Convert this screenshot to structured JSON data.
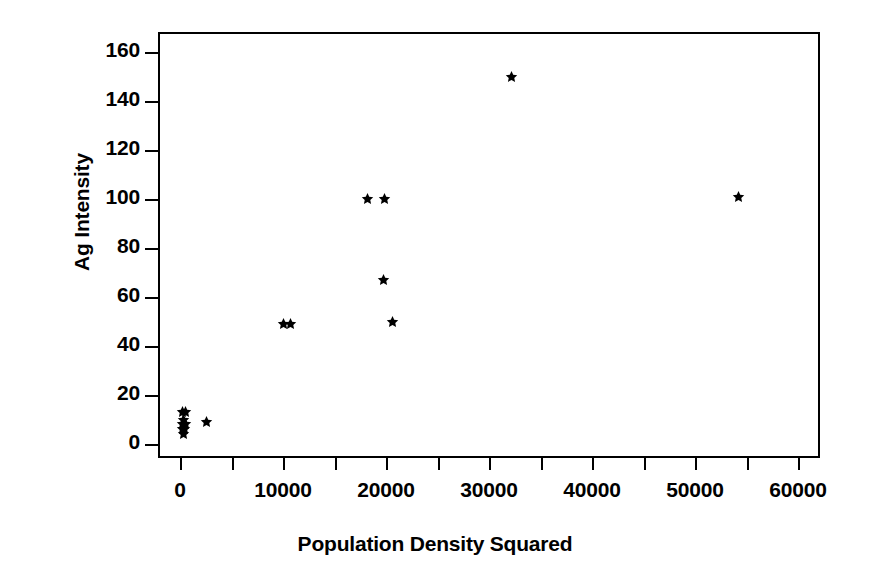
{
  "chart_data": {
    "type": "scatter",
    "title": "",
    "xlabel": "Population Density Squared",
    "ylabel": "Ag Intensity",
    "xlim": [
      -1500,
      64000
    ],
    "ylim": [
      -5,
      168
    ],
    "grid": false,
    "legend": null,
    "marker_style": "star",
    "marker_color": "#000000",
    "xticks": [
      0,
      10000,
      20000,
      30000,
      40000,
      50000,
      60000
    ],
    "xtick_labels": [
      "0",
      "10000",
      "20000",
      "30000",
      "40000",
      "50000",
      "60000"
    ],
    "xticks_minor": [
      5000,
      15000,
      25000,
      35000,
      45000,
      55000
    ],
    "yticks": [
      0,
      20,
      40,
      60,
      80,
      100,
      120,
      140,
      160
    ],
    "ytick_labels": [
      "0",
      "20",
      "40",
      "60",
      "80",
      "100",
      "120",
      "140",
      "160"
    ],
    "points": [
      {
        "x": 60,
        "y": 14
      },
      {
        "x": 330,
        "y": 14
      },
      {
        "x": 120,
        "y": 11
      },
      {
        "x": 60,
        "y": 9
      },
      {
        "x": 330,
        "y": 9
      },
      {
        "x": 90,
        "y": 7
      },
      {
        "x": 250,
        "y": 7
      },
      {
        "x": 150,
        "y": 5
      },
      {
        "x": 2400,
        "y": 10
      },
      {
        "x": 9900,
        "y": 50
      },
      {
        "x": 10500,
        "y": 50
      },
      {
        "x": 18000,
        "y": 101
      },
      {
        "x": 19700,
        "y": 101
      },
      {
        "x": 19600,
        "y": 68
      },
      {
        "x": 20400,
        "y": 51
      },
      {
        "x": 32000,
        "y": 151
      },
      {
        "x": 54000,
        "y": 102
      }
    ]
  },
  "axis": {
    "x_title": "Population Density Squared",
    "y_title": "Ag Intensity"
  }
}
